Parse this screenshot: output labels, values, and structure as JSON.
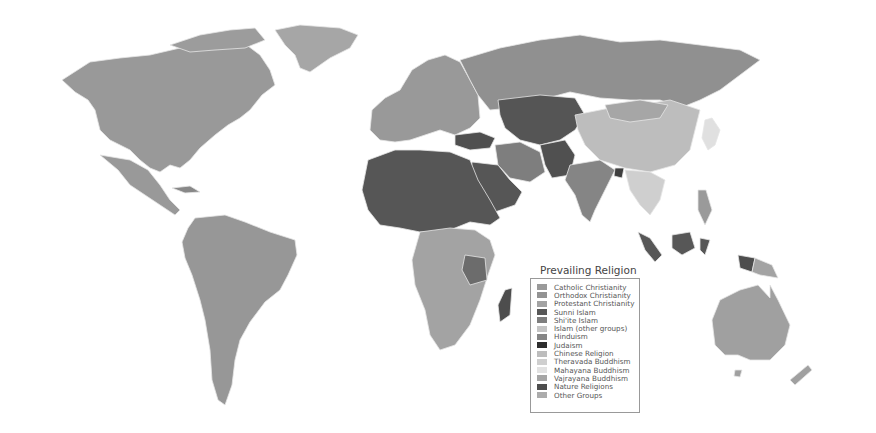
{
  "legend": {
    "title": "Prevailing Religion",
    "items": [
      {
        "label": "Catholic Christianity",
        "color": "#9a9a9a"
      },
      {
        "label": "Orthodox Christianity",
        "color": "#939393"
      },
      {
        "label": "Protestant Christianity",
        "color": "#a3a3a3"
      },
      {
        "label": "Sunni Islam",
        "color": "#575757"
      },
      {
        "label": "Shi'ite Islam",
        "color": "#7e7e7e"
      },
      {
        "label": "Islam (other groups)",
        "color": "#c4c4c4"
      },
      {
        "label": "Hinduism",
        "color": "#858585"
      },
      {
        "label": "Judaism",
        "color": "#2e2e2e"
      },
      {
        "label": "Chinese Religion",
        "color": "#bdbdbd"
      },
      {
        "label": "Theravada Buddhism",
        "color": "#cfcfcf"
      },
      {
        "label": "Mahayana Buddhism",
        "color": "#e2e2e2"
      },
      {
        "label": "Vajrayana Buddhism",
        "color": "#a6a6a6"
      },
      {
        "label": "Nature Religions",
        "color": "#4d4d4d"
      },
      {
        "label": "Other Groups",
        "color": "#acacac"
      }
    ]
  }
}
